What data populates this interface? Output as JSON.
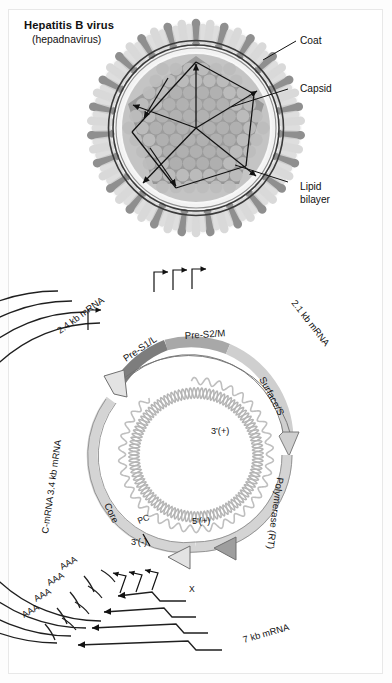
{
  "figure": {
    "title": "Hepatitis B virus",
    "subtitle": "(hepadnavirus)"
  },
  "virion": {
    "callouts": [
      {
        "id": "coat",
        "label": "Coat"
      },
      {
        "id": "capsid",
        "label": "Capsid"
      },
      {
        "id": "lipid_bilayer",
        "label": "Lipid\nbilayer"
      },
      {
        "id": "lipid_bilayer_line1",
        "label": "Lipid"
      },
      {
        "id": "lipid_bilayer_line2",
        "label": "bilayer"
      }
    ],
    "colors": {
      "spike_dark": "#8f8f8f",
      "spike_light": "#d9d9d9",
      "envelope_line": "#3a3a3a",
      "capsid_fill": "#9e9e9e",
      "capsid_subunit": "#bdbdbd",
      "halo": "#efefef"
    }
  },
  "genome": {
    "transcripts": [
      {
        "id": "mrna_2_4",
        "label": "2.4 kb mRNA"
      },
      {
        "id": "mrna_2_1",
        "label": "2.1 kb mRNA"
      },
      {
        "id": "mrna_c_3_4",
        "label": "C-mRNA 3.4 kb mRNA"
      },
      {
        "id": "mrna_7",
        "label": "7 kb mRNA"
      }
    ],
    "genes": [
      {
        "id": "pre_s1_l",
        "label": "Pre-S1/L",
        "color": "#7d7d7d"
      },
      {
        "id": "pre_s2_m",
        "label": "Pre-S2/M",
        "color": "#a8a8a8"
      },
      {
        "id": "surface_s",
        "label": "Surface/S",
        "color": "#cfcfcf"
      },
      {
        "id": "polymerase",
        "label": "Polymerase (RT)",
        "color": "#d4d4d4"
      },
      {
        "id": "core",
        "label": "Core",
        "color": "#d4d4d4"
      },
      {
        "id": "pre_core",
        "label": "PC"
      },
      {
        "id": "x_gene",
        "label": "X"
      }
    ],
    "dna_termini": [
      {
        "id": "three_prime_plus",
        "label": "3'(+)"
      },
      {
        "id": "five_prime_plus",
        "label": "5'(+)"
      },
      {
        "id": "three_prime_minus",
        "label": "3'(-)"
      }
    ],
    "poly_a_tails": [
      "AAA",
      "AAA",
      "AAA",
      "AAA"
    ],
    "promoter_count_top": 3,
    "promoter_count_bottom": 3,
    "colors": {
      "arc_line": "#1f1f1f",
      "dna_minus": "#b5b5b5",
      "dna_plus": "#bfbfbf",
      "orf_stroke": "#6f6f6f"
    }
  }
}
